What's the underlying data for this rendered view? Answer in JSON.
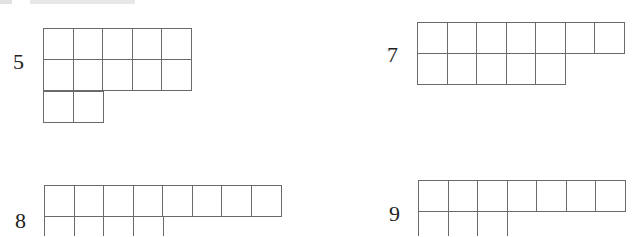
{
  "page": {
    "line_color": "#6a6a6a"
  },
  "figures": [
    {
      "label": "5",
      "rows": [
        5,
        5,
        2
      ],
      "position": "top-left"
    },
    {
      "label": "7",
      "rows": [
        7,
        5
      ],
      "position": "top-right"
    },
    {
      "label": "8",
      "rows": [
        8,
        4
      ],
      "position": "bottom-left",
      "cut_off": true
    },
    {
      "label": "9",
      "rows": [
        7,
        3
      ],
      "position": "bottom-right",
      "cut_off": true
    }
  ]
}
